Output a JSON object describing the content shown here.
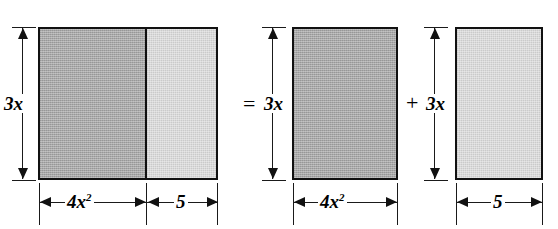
{
  "figure": {
    "kind": "area-model-distributive-property",
    "equation_text": "3x(4x^2 + 5) = 3x(4x^2) + 3x(5)",
    "operators": {
      "equals": "=",
      "plus": "+"
    },
    "groups": [
      {
        "id": "combined",
        "height_label": "3x",
        "parts": [
          {
            "id": "combined-left",
            "width_label": "4x",
            "width_exponent": "2",
            "shade": "dark"
          },
          {
            "id": "combined-right",
            "width_label": "5",
            "width_exponent": "",
            "shade": "light"
          }
        ]
      },
      {
        "id": "first-term",
        "height_label": "3x",
        "parts": [
          {
            "id": "first-term-body",
            "width_label": "4x",
            "width_exponent": "2",
            "shade": "dark"
          }
        ]
      },
      {
        "id": "second-term",
        "height_label": "3x",
        "parts": [
          {
            "id": "second-term-body",
            "width_label": "5",
            "width_exponent": "",
            "shade": "light"
          }
        ]
      }
    ],
    "colors": {
      "background": "#ffffff",
      "ink": "#111111",
      "shade_dark": "#a8a8a8",
      "shade_light": "#d9d9d9"
    }
  }
}
